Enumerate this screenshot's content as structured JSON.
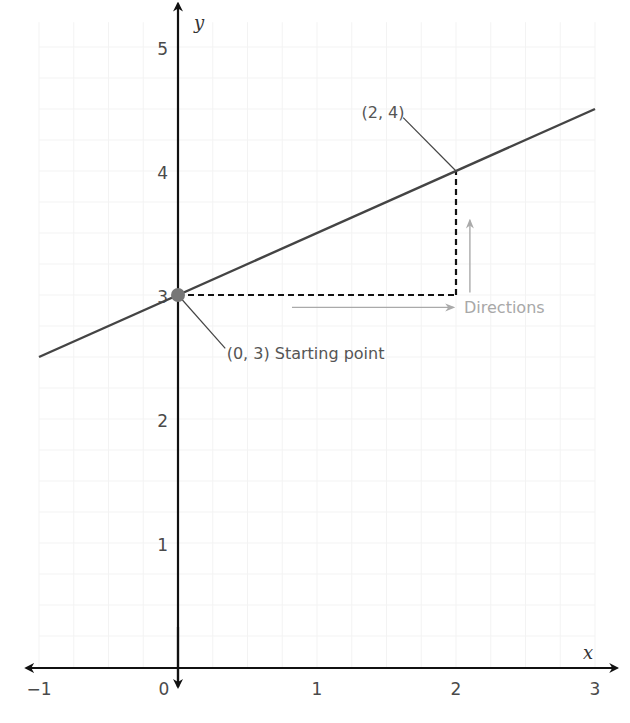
{
  "chart_data": {
    "type": "line",
    "title": "",
    "xlabel": "x",
    "ylabel": "y",
    "xlim": [
      -1,
      3
    ],
    "ylim": [
      0,
      5
    ],
    "x_ticks": [
      -1,
      0,
      1,
      2,
      3
    ],
    "x_tick_labels": [
      "−1",
      "0",
      "1",
      "2",
      "3"
    ],
    "y_ticks": [
      1,
      2,
      3,
      4,
      5
    ],
    "y_tick_labels": [
      "1",
      "2",
      "3",
      "4",
      "5"
    ],
    "grid": true,
    "series": [
      {
        "name": "line",
        "equation": "y = 0.5x + 3",
        "x": [
          -1,
          3
        ],
        "y": [
          2.5,
          4.5
        ],
        "color": "#444444"
      }
    ],
    "points": [
      {
        "name": "starting-point",
        "x": 0,
        "y": 3,
        "label": "(0, 3) Starting point",
        "color": "#777777"
      },
      {
        "name": "second-point",
        "x": 2,
        "y": 4,
        "label": "(2, 4)"
      }
    ],
    "guides": {
      "horizontal": {
        "from": [
          0,
          3
        ],
        "to": [
          2,
          3
        ],
        "style": "dashed"
      },
      "vertical": {
        "from": [
          2,
          3
        ],
        "to": [
          2,
          4
        ],
        "style": "dashed"
      }
    },
    "annotations": {
      "directions_label": "Directions",
      "directions_color": "#a8a8a8"
    }
  }
}
